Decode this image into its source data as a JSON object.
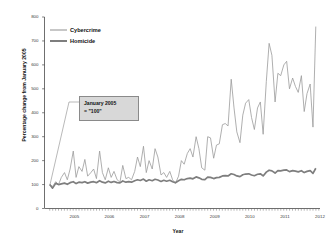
{
  "chart_data": {
    "type": "line",
    "title": "",
    "xlabel": "Year",
    "ylabel": "Percentage change from January 2005",
    "xlim": [
      2004.6,
      2012.45
    ],
    "ylim": [
      0,
      800
    ],
    "yticks": [
      0,
      100,
      200,
      300,
      400,
      500,
      600,
      700,
      800
    ],
    "xticks": [
      2005,
      2006,
      2007,
      2008,
      2009,
      2010,
      2011,
      2012
    ],
    "xtick_labels": [
      "2005",
      "2006",
      "2007",
      "2008",
      "2009",
      "2010",
      "2011",
      "2012"
    ],
    "ytick_labels": [
      "0",
      "100",
      "200",
      "300",
      "400",
      "500",
      "600",
      "700",
      "800"
    ],
    "grid": false,
    "legend_position": "upper left",
    "annotations": [
      {
        "text_line1": "January 2005",
        "text_line2": "= \"100\"",
        "points_to_x": 2004.75,
        "points_to_y": 95
      }
    ],
    "colors": {
      "cybercrime": "#9a9a9a",
      "homicide": "#7e7e7e",
      "axis": "#4a4a4a",
      "annotation_box": "#d8d8d8"
    },
    "series": [
      {
        "name": "Cybercrime",
        "line_width": 0.8,
        "x": [
          2004.75,
          2004.83,
          2004.92,
          2005.0,
          2005.08,
          2005.17,
          2005.25,
          2005.33,
          2005.42,
          2005.5,
          2005.58,
          2005.67,
          2005.75,
          2005.83,
          2005.92,
          2006.0,
          2006.08,
          2006.17,
          2006.25,
          2006.33,
          2006.42,
          2006.5,
          2006.58,
          2006.67,
          2006.75,
          2006.83,
          2006.92,
          2007.0,
          2007.08,
          2007.17,
          2007.25,
          2007.33,
          2007.42,
          2007.5,
          2007.58,
          2007.67,
          2007.75,
          2007.83,
          2007.92,
          2008.0,
          2008.08,
          2008.17,
          2008.25,
          2008.33,
          2008.42,
          2008.5,
          2008.58,
          2008.67,
          2008.75,
          2008.83,
          2008.92,
          2009.0,
          2009.08,
          2009.17,
          2009.25,
          2009.33,
          2009.42,
          2009.5,
          2009.58,
          2009.67,
          2009.75,
          2009.83,
          2009.92,
          2010.0,
          2010.08,
          2010.17,
          2010.25,
          2010.33,
          2010.42,
          2010.5,
          2010.58,
          2010.67,
          2010.75,
          2010.83,
          2010.92,
          2011.0,
          2011.08,
          2011.17,
          2011.25,
          2011.33,
          2011.42,
          2011.5,
          2011.58,
          2011.67,
          2011.75,
          2011.83,
          2011.92,
          2012.0,
          2012.08,
          2012.17,
          2012.25,
          2012.33
        ],
        "values": [
          100,
          92,
          112,
          100,
          130,
          150,
          120,
          165,
          240,
          130,
          175,
          155,
          205,
          135,
          150,
          165,
          125,
          240,
          150,
          120,
          170,
          130,
          155,
          120,
          110,
          180,
          125,
          130,
          120,
          155,
          215,
          175,
          260,
          150,
          200,
          165,
          250,
          215,
          140,
          150,
          130,
          155,
          120,
          105,
          135,
          200,
          185,
          230,
          250,
          215,
          300,
          250,
          170,
          160,
          300,
          295,
          210,
          265,
          270,
          350,
          355,
          345,
          540,
          420,
          320,
          275,
          390,
          440,
          455,
          380,
          330,
          420,
          445,
          310,
          530,
          690,
          640,
          445,
          565,
          555,
          600,
          615,
          500,
          545,
          510,
          485,
          555,
          405,
          480,
          520,
          340,
          760
        ]
      },
      {
        "name": "Homicide",
        "line_width": 1.7,
        "x": [
          2004.75,
          2004.83,
          2004.92,
          2005.0,
          2005.08,
          2005.17,
          2005.25,
          2005.33,
          2005.42,
          2005.5,
          2005.58,
          2005.67,
          2005.75,
          2005.83,
          2005.92,
          2006.0,
          2006.08,
          2006.17,
          2006.25,
          2006.33,
          2006.42,
          2006.5,
          2006.58,
          2006.67,
          2006.75,
          2006.83,
          2006.92,
          2007.0,
          2007.08,
          2007.17,
          2007.25,
          2007.33,
          2007.42,
          2007.5,
          2007.58,
          2007.67,
          2007.75,
          2007.83,
          2007.92,
          2008.0,
          2008.08,
          2008.17,
          2008.25,
          2008.33,
          2008.42,
          2008.5,
          2008.58,
          2008.67,
          2008.75,
          2008.83,
          2008.92,
          2009.0,
          2009.08,
          2009.17,
          2009.25,
          2009.33,
          2009.42,
          2009.5,
          2009.58,
          2009.67,
          2009.75,
          2009.83,
          2009.92,
          2010.0,
          2010.08,
          2010.17,
          2010.25,
          2010.33,
          2010.42,
          2010.5,
          2010.58,
          2010.67,
          2010.75,
          2010.83,
          2010.92,
          2011.0,
          2011.08,
          2011.17,
          2011.25,
          2011.33,
          2011.42,
          2011.5,
          2011.58,
          2011.67,
          2011.75,
          2011.83,
          2011.92,
          2012.0,
          2012.08,
          2012.17,
          2012.25,
          2012.33
        ],
        "values": [
          100,
          85,
          105,
          100,
          103,
          106,
          101,
          108,
          112,
          104,
          110,
          108,
          112,
          106,
          110,
          112,
          108,
          116,
          110,
          107,
          114,
          109,
          113,
          108,
          107,
          115,
          110,
          112,
          110,
          116,
          120,
          117,
          123,
          114,
          120,
          116,
          122,
          119,
          113,
          118,
          114,
          118,
          112,
          108,
          116,
          122,
          120,
          125,
          127,
          124,
          132,
          128,
          122,
          121,
          131,
          130,
          125,
          129,
          130,
          136,
          137,
          136,
          145,
          142,
          136,
          133,
          141,
          144,
          145,
          140,
          137,
          143,
          145,
          136,
          152,
          160,
          157,
          148,
          158,
          157,
          160,
          161,
          154,
          158,
          156,
          153,
          158,
          150,
          155,
          158,
          147,
          168
        ]
      }
    ]
  },
  "legend": {
    "items": [
      {
        "label": "Cybercrime",
        "style": "thin"
      },
      {
        "label": "Homicide",
        "style": "thick"
      }
    ]
  }
}
